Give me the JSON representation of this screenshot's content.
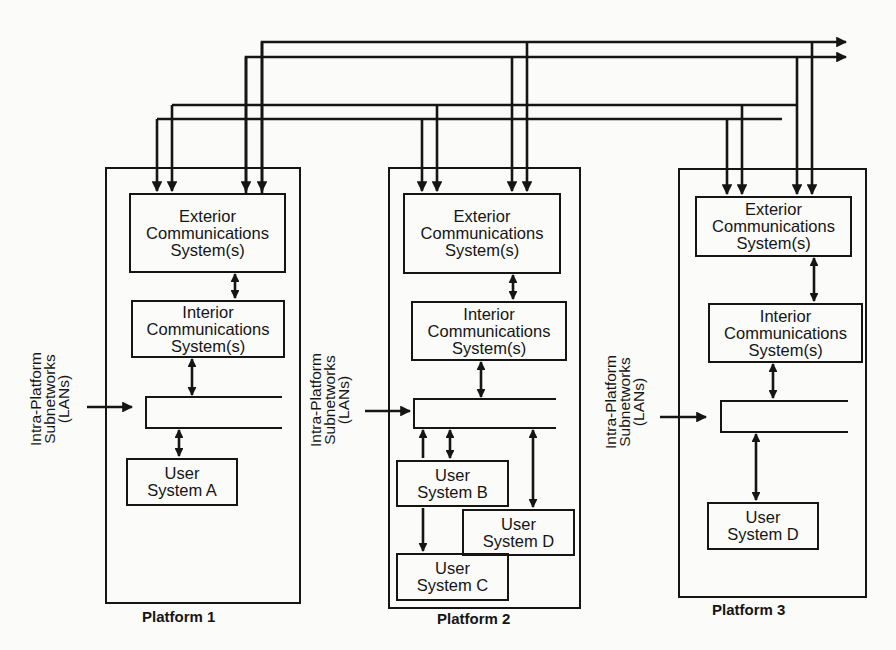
{
  "diagram": {
    "platforms": [
      {
        "label": "Platform 1",
        "exterior": [
          "Exterior",
          "Communications",
          "System(s)"
        ],
        "interior": [
          "Interior",
          "Communications",
          "System(s)"
        ],
        "subnet_label": [
          "Intra-Platform",
          "Subnetworks",
          "(LANs)"
        ],
        "users": [
          {
            "line1": "User",
            "line2": "System A"
          }
        ]
      },
      {
        "label": "Platform 2",
        "exterior": [
          "Exterior",
          "Communications",
          "System(s)"
        ],
        "interior": [
          "Interior",
          "Communications",
          "System(s)"
        ],
        "subnet_label": [
          "Intra-Platform",
          "Subnetworks",
          "(LANs)"
        ],
        "users": [
          {
            "line1": "User",
            "line2": "System B"
          },
          {
            "line1": "User",
            "line2": "System D"
          },
          {
            "line1": "User",
            "line2": "System C"
          }
        ]
      },
      {
        "label": "Platform 3",
        "exterior": [
          "Exterior",
          "Communications",
          "System(s)"
        ],
        "interior": [
          "Interior",
          "Communications",
          "System(s)"
        ],
        "subnet_label": [
          "Intra-Platform",
          "Subnetworks",
          "(LANs)"
        ],
        "users": [
          {
            "line1": "User",
            "line2": "System D"
          }
        ]
      }
    ],
    "buses": [
      {
        "name": "external-link-1",
        "y": 42
      },
      {
        "name": "external-link-2",
        "y": 57
      },
      {
        "name": "inter-platform-link-3",
        "y": 105
      },
      {
        "name": "inter-platform-link-4",
        "y": 119
      }
    ],
    "colors": {
      "line": "#151515",
      "background": "#fbfbf9"
    }
  }
}
